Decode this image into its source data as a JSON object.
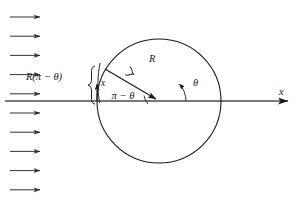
{
  "figure": {
    "domain": "Diagram",
    "background_color": "#ffffff",
    "width": 304,
    "height": 209
  },
  "colors": {
    "stroke": "#1a1a1a",
    "axis": "#4d4d4d",
    "flow_arrow": "#333333",
    "circle": "#1a1a1a",
    "brace": "#1a1a1a",
    "text": "#1a1a1a"
  },
  "flow_field": {
    "name": "incoming-uniform-flow",
    "arrow_count": 10,
    "direction": "left-to-right",
    "arrow_x_start": 10,
    "arrow_x_end": 42,
    "arrow_y_first": 17,
    "arrow_y_spacing": 19.2
  },
  "cylinder": {
    "name": "cylinder-circle",
    "center_x": 159,
    "center_y": 101,
    "radius": 62
  },
  "axis": {
    "name": "x-axis",
    "y": 101,
    "x_start": 5,
    "x_end": 292,
    "label": "x",
    "label_x": 281,
    "label_y": 94
  },
  "radius_vector": {
    "name": "radius-vector",
    "from_x": 105,
    "from_y": 69,
    "to_x": 159,
    "to_y": 101,
    "label": "R",
    "label_x": 150,
    "label_y": 61
  },
  "angles": [
    {
      "name": "angle-theta",
      "label": "θ",
      "label_x": 194,
      "label_y": 85,
      "description": "angle between positive x-axis and radius vector direction"
    },
    {
      "name": "angle-pi-minus-theta",
      "label": "π − θ",
      "label_x": 110,
      "label_y": 99,
      "description": "supplementary angle measured from negative x direction"
    }
  ],
  "arc_length": {
    "name": "arc-length-brace",
    "label": "R(π − θ)",
    "label_x": 22,
    "label_y": 80,
    "brace_x": 92,
    "brace_top_y": 66,
    "brace_bottom_y": 103
  },
  "coordinate_x": {
    "name": "local-x-marker",
    "label": "x",
    "label_x": 100,
    "label_y": 86,
    "arrow_x": 95,
    "arrow_top_y": 84,
    "arrow_bottom_y": 101
  }
}
